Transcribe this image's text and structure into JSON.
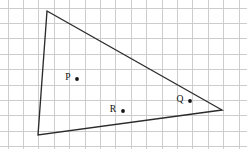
{
  "figure": {
    "canvas": {
      "width": 247,
      "height": 149,
      "background": "#ffffff"
    },
    "grid": {
      "visible": true,
      "cell_size": 15.4,
      "origin_x": 8,
      "origin_y": 8,
      "color": "#c8c8c8",
      "line_width": 0.9
    },
    "shape": {
      "name": "triangle",
      "stroke_color": "#2b2b2b",
      "stroke_width": 1.35,
      "fill": "none",
      "vertices": [
        {
          "name": "top-vertex",
          "x": 47,
          "y": 11
        },
        {
          "name": "right-vertex",
          "x": 222,
          "y": 110
        },
        {
          "name": "bottom-left-vertex",
          "x": 38,
          "y": 135
        }
      ]
    },
    "points": [
      {
        "label": "P",
        "label_x": 68,
        "label_y": 78,
        "dot_x": 77,
        "dot_y": 79,
        "dot_radius": 1.9,
        "dot_color": "#151515"
      },
      {
        "label": "Q",
        "label_x": 180,
        "label_y": 100,
        "dot_x": 190,
        "dot_y": 101,
        "dot_radius": 1.9,
        "dot_color": "#151515"
      },
      {
        "label": "R",
        "label_x": 113,
        "label_y": 110,
        "dot_x": 123,
        "dot_y": 111,
        "dot_radius": 1.9,
        "dot_color": "#151515"
      }
    ]
  }
}
